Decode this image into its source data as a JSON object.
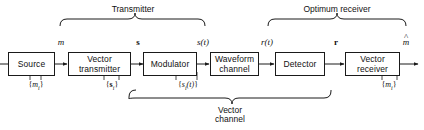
{
  "diagram": {
    "stroke_color": "#1a1a1a",
    "background": "#ffffff"
  },
  "groups": [
    {
      "id": "transmitter",
      "label": "Transmitter"
    },
    {
      "id": "optimum-receiver",
      "label": "Optimum receiver"
    },
    {
      "id": "vector-channel",
      "label_line1": "Vector",
      "label_line2": "channel"
    }
  ],
  "blocks": [
    {
      "id": "source",
      "line1": "Source",
      "line2": ""
    },
    {
      "id": "vector-transmitter",
      "line1": "Vector",
      "line2": "transmitter"
    },
    {
      "id": "modulator",
      "line1": "Modulator",
      "line2": ""
    },
    {
      "id": "waveform-channel",
      "line1": "Waveform",
      "line2": "channel"
    },
    {
      "id": "detector",
      "line1": "Detector",
      "line2": ""
    },
    {
      "id": "vector-receiver",
      "line1": "Vector",
      "line2": "receiver"
    }
  ],
  "signals": [
    {
      "id": "m",
      "label": "m",
      "style": "italic"
    },
    {
      "id": "s",
      "label": "s",
      "style": "bold"
    },
    {
      "id": "s-t",
      "label": "s(t)",
      "style": "italic"
    },
    {
      "id": "r-t",
      "label": "r(t)",
      "style": "italic"
    },
    {
      "id": "r",
      "label": "r",
      "style": "bold"
    },
    {
      "id": "m-hat",
      "label": "m",
      "style": "italic-hat"
    }
  ],
  "set_labels": [
    {
      "id": "set-mi",
      "open": "{",
      "symbol": "m",
      "sub": "i",
      "suffix": "",
      "close": "}",
      "style": "italic"
    },
    {
      "id": "set-si",
      "open": "{",
      "symbol": "s",
      "sub": "i",
      "suffix": "",
      "close": "}",
      "style": "bold"
    },
    {
      "id": "set-sit",
      "open": "{",
      "symbol": "s",
      "sub": "i",
      "suffix": "(t)",
      "close": "}",
      "style": "italic"
    },
    {
      "id": "set-mi-2",
      "open": "{",
      "symbol": "m",
      "sub": "i",
      "suffix": "",
      "close": "}",
      "style": "italic"
    }
  ]
}
